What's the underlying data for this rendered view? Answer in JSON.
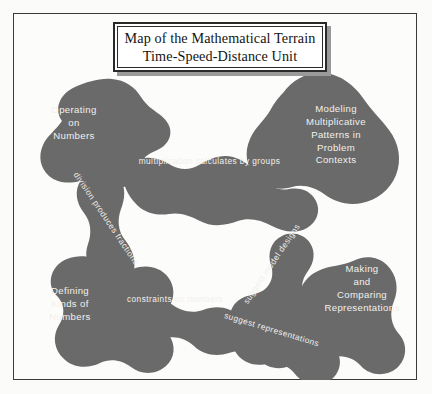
{
  "document": {
    "title_line1": "Map of the Mathematical Terrain",
    "title_line2": "Time-Speed-Distance Unit"
  },
  "colors": {
    "terrain_fill": "#6a6a6a",
    "page_background": "#fbfbfa",
    "frame_border": "#3a3a3a",
    "label_text": "#f2f0ec",
    "title_text": "#141414",
    "title_shadow": "#9a9a9a"
  },
  "map": {
    "regions": [
      {
        "id": "operating-on-numbers",
        "lines": [
          "Operating",
          "on",
          "Numbers"
        ]
      },
      {
        "id": "modeling-multiplicative",
        "lines": [
          "Modeling",
          "Multiplicative",
          "Patterns in",
          "Problem",
          "Contexts"
        ]
      },
      {
        "id": "defining-kinds-of-numbers",
        "lines": [
          "Defining",
          "Kinds of",
          "Numbers"
        ]
      },
      {
        "id": "making-and-comparing",
        "lines": [
          "Making",
          "and",
          "Comparing",
          "Representations"
        ]
      }
    ],
    "connections": [
      {
        "id": "multiplication-calculates-by-groups",
        "label": "multiplication calculates by groups",
        "orientation": "horizontal"
      },
      {
        "id": "division-produces-fractions",
        "label": "division produces fractions",
        "orientation": "diagonal-down"
      },
      {
        "id": "suggest-model-designs",
        "label": "suggest model designs",
        "orientation": "diagonal-up"
      },
      {
        "id": "constraints-on-numbers",
        "label": "constraints on numbers",
        "orientation": "horizontal"
      },
      {
        "id": "suggest-representations",
        "label": "suggest representations",
        "orientation": "diagonal-down"
      }
    ]
  }
}
